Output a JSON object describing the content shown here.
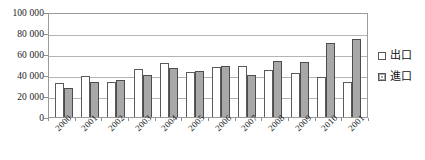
{
  "chart_data": {
    "type": "bar",
    "title": "",
    "subtitle": "",
    "xlabel": "",
    "ylabel": "",
    "ylim": [
      0,
      100000
    ],
    "ytick_step": 20000,
    "ytick_labels": [
      "100 000",
      "80 000",
      "60 000",
      "40 000",
      "20 000",
      "0"
    ],
    "ytick_values": [
      100000,
      80000,
      60000,
      40000,
      20000,
      0
    ],
    "grid": true,
    "legend_position": "right",
    "categories": [
      "2000",
      "2001",
      "2002",
      "2003",
      "2004",
      "2005",
      "2006",
      "2007",
      "2008",
      "2009",
      "2010",
      "2001"
    ],
    "series": [
      {
        "name": "出口",
        "color": "#ffffff",
        "border_color": "#5a5a5a",
        "values": [
          32500,
          39500,
          33500,
          46000,
          51500,
          43000,
          47500,
          48500,
          44500,
          41500,
          38500,
          33000
        ]
      },
      {
        "name": "進口",
        "color": "#a8a8a8",
        "border_color": "#4d4d4d",
        "values": [
          28000,
          33000,
          35500,
          40000,
          47000,
          43500,
          49000,
          40500,
          53000,
          52500,
          70500,
          74500
        ]
      }
    ]
  },
  "legend": {
    "items": [
      {
        "label": "出口",
        "marker": "hollow-square-icon"
      },
      {
        "label": "進口",
        "marker": "filled-square-icon"
      }
    ]
  },
  "colors": {
    "export_fill": "#ffffff",
    "import_fill": "#a8a8a8",
    "grid": "#b4b4b4",
    "frame": "#9a9a9a",
    "text": "#1a1a1a"
  }
}
